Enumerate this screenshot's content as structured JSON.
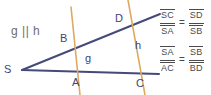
{
  "figure": {
    "width": 211,
    "height": 95,
    "background": "#ffffff",
    "ghost_text": "",
    "parallel_note": "g || h",
    "colors": {
      "ray": "#454a7a",
      "transversal": "#e0a962",
      "label": "#3f4473",
      "formula": "#4a4a4c",
      "note": "#6d6d70"
    }
  },
  "labels": {
    "vertex": "S",
    "point_b": "B",
    "point_a": "A",
    "point_d": "D",
    "point_c": "C",
    "line_g": "g",
    "line_h": "h"
  },
  "formulas": [
    {
      "id": "formula-1",
      "left": {
        "numerator": "SC",
        "denominator": "SA"
      },
      "relation": "=",
      "right": {
        "numerator": "SD",
        "denominator": "SB"
      }
    },
    {
      "id": "formula-2",
      "left": {
        "numerator": "SA",
        "denominator": "AC"
      },
      "relation": "=",
      "right": {
        "numerator": "SB",
        "denominator": "BD"
      }
    }
  ]
}
